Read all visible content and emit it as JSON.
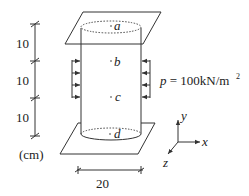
{
  "dimensions": {
    "vertical_segments": [
      "10",
      "10",
      "10"
    ],
    "unit": "(cm)",
    "diameter": "20"
  },
  "points": {
    "a": "a",
    "b": "b",
    "c": "c",
    "d": "d"
  },
  "load": {
    "label_p": "p",
    "label_eq": " = 100kN/m",
    "label_exp": "2"
  },
  "axes": {
    "x": "x",
    "y": "y",
    "z": "z"
  }
}
